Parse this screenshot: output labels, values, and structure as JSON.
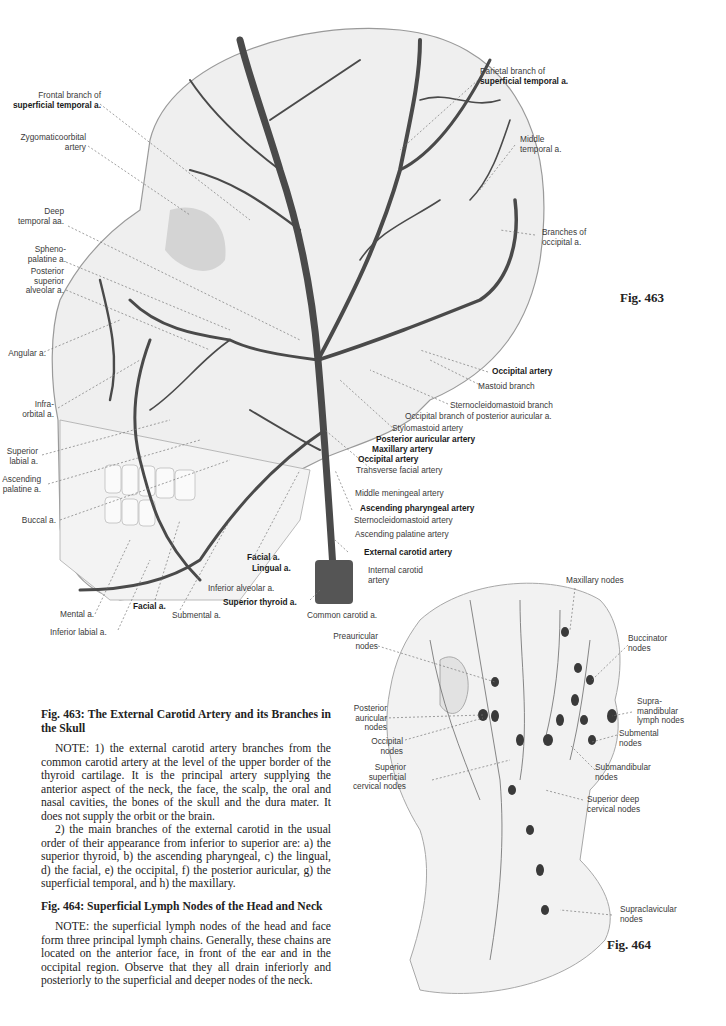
{
  "fig463": {
    "number": "Fig. 463",
    "labels_left": [
      {
        "id": "frontal",
        "lines": [
          "Frontal branch of"
        ],
        "bold": [
          "superficial temporal a."
        ]
      },
      {
        "id": "zygomaticoorbital",
        "lines": [
          "Zygomaticoorbital",
          "artery"
        ]
      },
      {
        "id": "deep-temporal",
        "lines": [
          "Deep",
          "temporal aa."
        ]
      },
      {
        "id": "sphenopalatine",
        "lines": [
          "Spheno-",
          "palatine a."
        ]
      },
      {
        "id": "posterior-superior-alveolar",
        "lines": [
          "Posterior",
          "superior",
          "alveolar a."
        ]
      },
      {
        "id": "angular",
        "lines": [
          "Angular a."
        ]
      },
      {
        "id": "infraorbital",
        "lines": [
          "Infra-",
          "orbital a."
        ]
      },
      {
        "id": "superior-labial",
        "lines": [
          "Superior",
          "labial a."
        ]
      },
      {
        "id": "ascending-palatine",
        "lines": [
          "Ascending",
          "palatine a."
        ]
      },
      {
        "id": "buccal",
        "lines": [
          "Buccal a."
        ]
      }
    ],
    "labels_top_right": {
      "parietal_1": "Parietal branch of",
      "parietal_2": "superficial temporal a.",
      "middle_temporal_1": "Middle",
      "middle_temporal_2": "temporal a.",
      "branches_occipital_1": "Branches of",
      "branches_occipital_2": "occipital a."
    },
    "labels_right": [
      {
        "text": "Occipital artery",
        "bold": true
      },
      {
        "text": "Mastoid branch",
        "bold": false
      },
      {
        "text": "Sternocleidomastoid branch",
        "bold": false
      },
      {
        "text": "Occipital branch of posterior auricular a.",
        "bold": false
      },
      {
        "text": "Stylomastoid artery",
        "bold": false
      },
      {
        "text": "Posterior auricular artery",
        "bold": true
      },
      {
        "text": "Maxillary artery",
        "bold": true
      },
      {
        "text": "Occipital artery",
        "bold": true
      },
      {
        "text": "Transverse facial artery",
        "bold": false
      },
      {
        "text": "Middle meningeal artery",
        "bold": false
      },
      {
        "text": "Ascending pharyngeal artery",
        "bold": true
      },
      {
        "text": "Sternocleidomastoid artery",
        "bold": false
      },
      {
        "text": "Ascending palatine artery",
        "bold": false
      },
      {
        "text": "External carotid artery",
        "bold": true
      }
    ],
    "labels_bottom": {
      "internal_carotid_1": "Internal carotid",
      "internal_carotid_2": "artery",
      "common_carotid": "Common carotid a.",
      "facial_upper": "Facial a.",
      "lingual": "Lingual a.",
      "inferior_alveolar": "Inferior alveolar a.",
      "superior_thyroid": "Superior thyroid a.",
      "facial_lower": "Facial a.",
      "submental": "Submental a.",
      "mental": "Mental a.",
      "inferior_labial": "Inferior labial a."
    }
  },
  "fig464": {
    "number": "Fig. 464",
    "labels": {
      "maxillary": "Maxillary nodes",
      "buccinator_1": "Buccinator",
      "buccinator_2": "nodes",
      "supramandibular_1": "Supra-",
      "supramandibular_2": "mandibular",
      "supramandibular_3": "lymph nodes",
      "submental_1": "Submental",
      "submental_2": "nodes",
      "submandibular_1": "Submandibular",
      "submandibular_2": "nodes",
      "superior_deep_1": "Superior deep",
      "superior_deep_2": "cervical nodes",
      "supraclavicular_1": "Supraclavicular",
      "supraclavicular_2": "nodes",
      "preauricular_1": "Preauricular",
      "preauricular_2": "nodes",
      "posterior_auricular_1": "Posterior",
      "posterior_auricular_2": "auricular",
      "posterior_auricular_3": "nodes",
      "occipital_1": "Occipital",
      "occipital_2": "nodes",
      "superior_superficial_1": "Superior",
      "superior_superficial_2": "superficial",
      "superior_superficial_3": "cervical nodes"
    }
  },
  "captions": {
    "fig463_title": "Fig. 463: The External Carotid Artery and its Branches in the Skull",
    "fig463_note1": "NOTE: 1) the external carotid artery branches from the common carotid artery at the level of the upper border of the thyroid cartilage. It is the principal artery supplying the anterior aspect of the neck, the face, the scalp, the oral and nasal cavities, the bones of the skull and the dura mater. It does not supply the orbit or the brain.",
    "fig463_note2": "2) the main branches of the external carotid in the usual order of their appearance from inferior to superior are: a) the superior thyroid, b) the ascending pharyngeal, c) the lingual, d) the facial, e) the occipital, f) the posterior auricular, g) the superficial temporal, and h) the maxillary.",
    "fig464_title": "Fig. 464: Superficial Lymph Nodes of the Head and Neck",
    "fig464_note": "NOTE: the superficial lymph nodes of the head and face form three principal lymph chains. Generally, these chains are located on the anterior face, in front of the ear and in the occipital region. Observe that they all drain inferiorly and posteriorly to the superficial and deeper nodes of the neck."
  }
}
